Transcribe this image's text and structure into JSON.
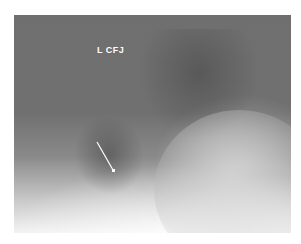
{
  "image": {
    "type": "radiograph",
    "label": "L CFJ",
    "annotation": "arrow"
  },
  "colors": {
    "background": "#ffffff",
    "label": "#ffffff",
    "arrow": "#ffffff"
  }
}
